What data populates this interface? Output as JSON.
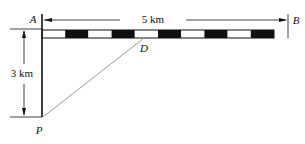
{
  "diagram": {
    "points": {
      "A": {
        "label": "A",
        "x": 42,
        "y": 30
      },
      "B": {
        "label": "B",
        "x": 288,
        "y": 30
      },
      "D": {
        "label": "D",
        "x": 144,
        "y": 38
      },
      "P": {
        "label": "P",
        "x": 42,
        "y": 117
      }
    },
    "dimensions": {
      "horizontal": {
        "label": "5 km",
        "from": "A",
        "to": "B"
      },
      "vertical": {
        "label": "3 km",
        "from": "A",
        "to": "P"
      }
    },
    "bar": {
      "segments": 10,
      "first_color": "#ffffff",
      "alt_color": "#111111"
    },
    "line_color": "#111111",
    "diagonal_color": "#999999"
  }
}
